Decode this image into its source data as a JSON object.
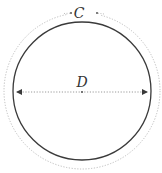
{
  "diagram": {
    "type": "circle-circumference-diameter",
    "circumference_label": "C",
    "diameter_label": "D",
    "colors": {
      "circle_stroke": "#3a3a3a",
      "dotted_circle": "#bdbdbd",
      "diameter_line": "#9a9a9a",
      "arrowhead": "#3a3a3a",
      "label": "#333333",
      "background": "#ffffff"
    }
  }
}
